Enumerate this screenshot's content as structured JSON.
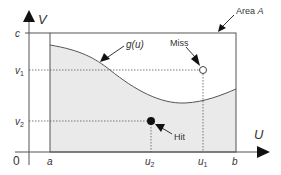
{
  "diagram": {
    "type": "monte-carlo-hit-or-miss",
    "axes": {
      "x_label": "U",
      "y_label": "V",
      "origin_label": "0"
    },
    "x_ticks": {
      "a": "a",
      "u2": "u",
      "u2_sub": "2",
      "u1": "u",
      "u1_sub": "1",
      "b": "b"
    },
    "y_ticks": {
      "c": "c",
      "v1": "v",
      "v1_sub": "1",
      "v2": "v",
      "v2_sub": "2"
    },
    "annotations": {
      "area_prefix": "Area ",
      "area_var": "A",
      "curve_label_fn": "g",
      "curve_label_arg": "(u)",
      "miss_label": "Miss",
      "hit_label": "Hit"
    },
    "points": [
      {
        "name": "Miss",
        "u": "u1",
        "v": "v1",
        "style": "open-circle"
      },
      {
        "name": "Hit",
        "u": "u2",
        "v": "v2",
        "style": "filled-circle"
      }
    ],
    "colors": {
      "fill_under_curve": "#eaeaea",
      "stroke": "#555555",
      "text": "#333333",
      "background": "#ffffff"
    }
  }
}
